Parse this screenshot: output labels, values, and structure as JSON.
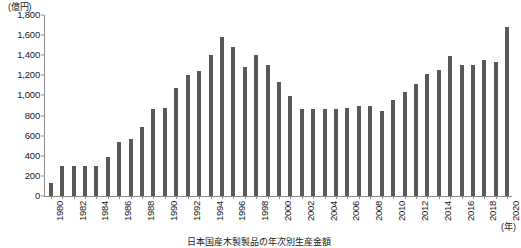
{
  "chart_data": {
    "type": "bar",
    "title": "",
    "caption": "日本国産木製製品の年次別生産金額",
    "xlabel": "(年)",
    "ylabel": "(億円)",
    "yunit": "(億円)",
    "ylim": [
      0,
      1800
    ],
    "ytick_step": 200,
    "yticks": [
      "0",
      "200",
      "400",
      "600",
      "800",
      "1,000",
      "1,200",
      "1,400",
      "1,600",
      "1,800"
    ],
    "ytick_values": [
      0,
      200,
      400,
      600,
      800,
      1000,
      1200,
      1400,
      1600,
      1800
    ],
    "grid": false,
    "legend": "none",
    "bar_color": "#595959",
    "axis_color": "#8d8d8d",
    "xtick_labels": [
      "1980",
      "1982",
      "1984",
      "1986",
      "1988",
      "1990",
      "1992",
      "1994",
      "1996",
      "1998",
      "2000",
      "2002",
      "2004",
      "2006",
      "2008",
      "2010",
      "2012",
      "2014",
      "2016",
      "2018",
      "2020"
    ],
    "xtick_interval": 2,
    "categories": [
      "1980",
      "1981",
      "1982",
      "1983",
      "1984",
      "1985",
      "1986",
      "1987",
      "1988",
      "1989",
      "1990",
      "1991",
      "1992",
      "1993",
      "1994",
      "1995",
      "1996",
      "1997",
      "1998",
      "1999",
      "2000",
      "2001",
      "2002",
      "2003",
      "2004",
      "2005",
      "2006",
      "2007",
      "2008",
      "2009",
      "2010",
      "2011",
      "2012",
      "2013",
      "2014",
      "2015",
      "2016",
      "2017",
      "2018",
      "2019",
      "2020"
    ],
    "values": [
      130,
      300,
      300,
      300,
      300,
      390,
      540,
      570,
      690,
      870,
      880,
      1070,
      1200,
      1240,
      1400,
      1580,
      1480,
      1280,
      1400,
      1300,
      1130,
      990,
      870,
      870,
      870,
      870,
      880,
      900,
      900,
      850,
      950,
      1030,
      1110,
      1210,
      1250,
      1390,
      1300,
      1300,
      1350,
      1330,
      1680
    ]
  }
}
